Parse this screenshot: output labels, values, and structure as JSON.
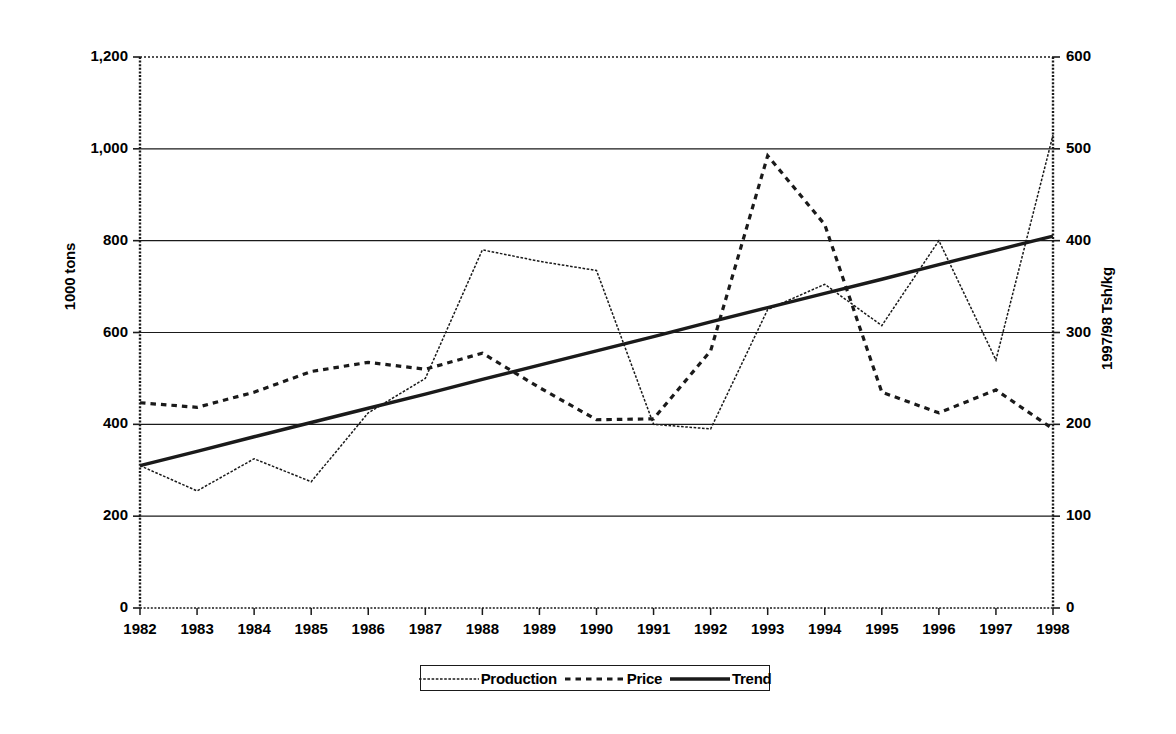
{
  "chart_data": {
    "type": "line",
    "title": "",
    "xlabel": "",
    "ylabel": "1000 tons",
    "y2label": "1997/98 Tsh/kg",
    "grid": true,
    "legend_position": "bottom",
    "x": [
      1982,
      1983,
      1984,
      1985,
      1986,
      1987,
      1988,
      1989,
      1990,
      1991,
      1992,
      1993,
      1994,
      1995,
      1996,
      1997,
      1998
    ],
    "categories": [
      "1982",
      "1983",
      "1984",
      "1985",
      "1986",
      "1987",
      "1988",
      "1989",
      "1990",
      "1991",
      "1992",
      "1993",
      "1994",
      "1995",
      "1996",
      "1997",
      "1998"
    ],
    "ylim": [
      0,
      1200
    ],
    "y2lim": [
      0,
      600
    ],
    "yticks": [
      "0",
      "200",
      "400",
      "600",
      "800",
      "1,000",
      "1,200"
    ],
    "ytick_values": [
      0,
      200,
      400,
      600,
      800,
      1000,
      1200
    ],
    "y2ticks": [
      "0",
      "100",
      "200",
      "300",
      "400",
      "500",
      "600"
    ],
    "y2tick_values": [
      0,
      100,
      200,
      300,
      400,
      500,
      600
    ],
    "series": [
      {
        "name": "Production",
        "axis": "left",
        "unit": "1000 tons",
        "style": "fine-dotted",
        "values": [
          310,
          255,
          325,
          275,
          425,
          500,
          780,
          755,
          735,
          400,
          390,
          650,
          705,
          615,
          800,
          540,
          1030
        ]
      },
      {
        "name": "Price",
        "axis": "right",
        "unit": "1997/98 Tsh/kg",
        "style": "dashed",
        "values_left_scale": [
          447,
          437,
          470,
          515,
          535,
          520,
          555,
          480,
          410,
          412,
          560,
          985,
          835,
          470,
          425,
          475,
          390
        ],
        "values": [
          223,
          218,
          235,
          257,
          267,
          260,
          277,
          240,
          205,
          206,
          280,
          492,
          417,
          235,
          213,
          237,
          195
        ]
      },
      {
        "name": "Trend",
        "axis": "left",
        "unit": "1000 tons",
        "style": "solid-thick",
        "values": [
          310,
          341,
          373,
          404,
          435,
          466,
          498,
          529,
          560,
          591,
          623,
          654,
          685,
          716,
          748,
          779,
          810
        ]
      }
    ]
  },
  "legend": {
    "items": [
      {
        "label": "Production",
        "swatch": "fine-dotted"
      },
      {
        "label": "Price",
        "swatch": "dashed"
      },
      {
        "label": "Trend",
        "swatch": "solid-thick"
      }
    ]
  },
  "axes": {
    "left_title": "1000 tons",
    "right_title": "1997/98 Tsh/kg"
  }
}
